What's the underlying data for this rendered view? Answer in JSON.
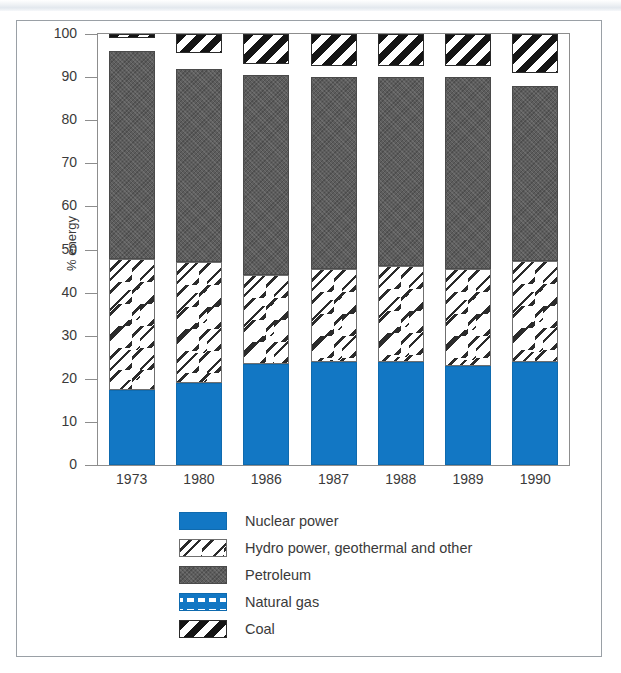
{
  "figure": {
    "y_axis_title": "% energy"
  },
  "chart_data": {
    "type": "bar",
    "title": "",
    "xlabel": "",
    "ylabel": "% energy",
    "ylim": [
      0,
      100
    ],
    "yticks": [
      0,
      10,
      20,
      30,
      40,
      50,
      60,
      70,
      80,
      90,
      100
    ],
    "grid": false,
    "stacked": true,
    "legend_position": "bottom",
    "categories": [
      "1973",
      "1980",
      "1986",
      "1987",
      "1988",
      "1989",
      "1990"
    ],
    "series": [
      {
        "name": "Nuclear power",
        "color": "#1277c4",
        "pattern": "solid",
        "values": [
          17.5,
          19.0,
          23.5,
          24.0,
          23.8,
          23.0,
          23.8
        ]
      },
      {
        "name": "Hydro power, geothermal and other",
        "color": "#ffffff",
        "pattern": "dashes",
        "values": [
          30.2,
          28.0,
          20.5,
          21.5,
          22.3,
          22.5,
          23.5
        ]
      },
      {
        "name": "Petroleum",
        "color": "#5d5d5d",
        "pattern": "stipple",
        "values": [
          48.3,
          45.0,
          46.5,
          44.5,
          43.9,
          44.5,
          40.7
        ]
      },
      {
        "name": "Natural gas",
        "color": "#1277c4",
        "pattern": "checks",
        "values": [
          3.0,
          3.5,
          2.5,
          2.5,
          2.5,
          2.5,
          3.0
        ]
      },
      {
        "name": "Coal",
        "color": "#151515",
        "pattern": "diagonal-stripes",
        "values": [
          1.0,
          4.5,
          7.0,
          7.5,
          7.5,
          7.5,
          9.0
        ]
      }
    ]
  },
  "legend": {
    "items": [
      {
        "label": "Nuclear power",
        "swatch": "nuclear-swatch"
      },
      {
        "label": "Hydro power, geothermal and other",
        "swatch": "hydro-swatch"
      },
      {
        "label": "Petroleum",
        "swatch": "petroleum-swatch"
      },
      {
        "label": "Natural gas",
        "swatch": "natural-gas-swatch"
      },
      {
        "label": "Coal",
        "swatch": "coal-swatch"
      }
    ]
  }
}
